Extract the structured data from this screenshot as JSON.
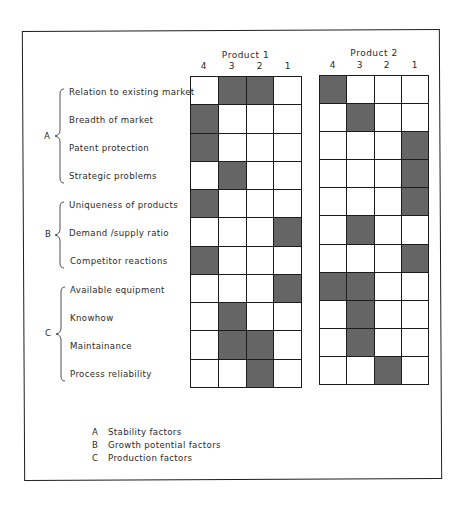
{
  "figure": {
    "products": [
      {
        "title": "Product 1",
        "columns": [
          "4",
          "3",
          "2",
          "1"
        ],
        "ratings": [
          [
            0,
            1,
            1,
            0
          ],
          [
            1,
            0,
            0,
            0
          ],
          [
            1,
            0,
            0,
            0
          ],
          [
            0,
            1,
            0,
            0
          ],
          [
            1,
            0,
            0,
            0
          ],
          [
            0,
            0,
            0,
            1
          ],
          [
            1,
            0,
            0,
            0
          ],
          [
            0,
            0,
            0,
            1
          ],
          [
            0,
            1,
            0,
            0
          ],
          [
            0,
            1,
            1,
            0
          ],
          [
            0,
            0,
            1,
            0
          ]
        ]
      },
      {
        "title": "Product 2",
        "columns": [
          "4",
          "3",
          "2",
          "1"
        ],
        "ratings": [
          [
            1,
            0,
            0,
            0
          ],
          [
            0,
            1,
            0,
            0
          ],
          [
            0,
            0,
            0,
            1
          ],
          [
            0,
            0,
            0,
            1
          ],
          [
            0,
            0,
            0,
            1
          ],
          [
            0,
            1,
            0,
            0
          ],
          [
            0,
            0,
            0,
            1
          ],
          [
            1,
            1,
            0,
            0
          ],
          [
            0,
            1,
            0,
            0
          ],
          [
            0,
            1,
            0,
            0
          ],
          [
            0,
            0,
            1,
            0
          ]
        ]
      }
    ],
    "groups": [
      {
        "letter": "A",
        "rows": [
          0,
          3
        ]
      },
      {
        "letter": "B",
        "rows": [
          4,
          6
        ]
      },
      {
        "letter": "C",
        "rows": [
          7,
          10
        ]
      }
    ],
    "factors": [
      "Relation to existing market",
      "Breadth of market",
      "Patent protection",
      "Strategic problems",
      "Uniqueness of products",
      "Demand /supply ratio",
      "Competitor reactions",
      "Available equipment",
      "Knowhow",
      "Maintainance",
      "Process reliability"
    ],
    "legend": [
      {
        "key": "A",
        "text": "Stability factors"
      },
      {
        "key": "B",
        "text": "Growth potential factors"
      },
      {
        "key": "C",
        "text": "Production factors"
      }
    ],
    "colors": {
      "shade": "#717171",
      "line": "#1c1c1c",
      "text": "#2a2a2a",
      "background": "#ffffff"
    }
  }
}
